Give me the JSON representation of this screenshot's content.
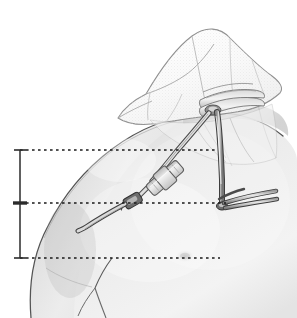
{
  "figure": {
    "title": "Tunneled central venous catheter placement on chest and neck",
    "domain_kind": "medical-illustration",
    "canvas": {
      "width": 297,
      "height": 318,
      "background": "#ffffff"
    },
    "style": {
      "line_color": "#3a3a3a",
      "skin_light": "#f2f2f2",
      "skin_mid": "#d8d8d8",
      "skin_shadow": "#b4b4b4",
      "drape_fill": "#fbfbfb",
      "drape_edge": "#9a9a9a",
      "tube_fill": "#cfcfcf",
      "tube_edge": "#4a4a4a",
      "dotted_color": "#1a1a1a",
      "scale_color": "#2b2b2b"
    },
    "parts": [
      {
        "id": "torso",
        "label": "patient-torso-shoulder",
        "description": "Left shoulder, upper chest and deltoid of a patient, shaded grayscale"
      },
      {
        "id": "neck",
        "label": "patient-neck",
        "description": "Neck region partly covered by the surgical drape"
      },
      {
        "id": "drape",
        "label": "surgical-drape",
        "description": "Translucent fenestrated surgical drape folded over the head and neck"
      },
      {
        "id": "drape-fold",
        "label": "drape-fold-stack",
        "description": "Layered folded edge of drape at the neck base"
      },
      {
        "id": "insertion-site",
        "label": "catheter-insertion-site",
        "description": "Venous puncture site at base of neck under the drape"
      },
      {
        "id": "tunneled-catheter",
        "label": "tunneled-catheter-tube",
        "description": "Catheter tunneled subcutaneously from neck across chest wall"
      },
      {
        "id": "connector",
        "label": "inline-catheter-connector",
        "description": "Barrel connector / suture wing on the tunneled catheter"
      },
      {
        "id": "clamp",
        "label": "catheter-clamp",
        "description": "Small clamp on the catheter at the mid reference level"
      },
      {
        "id": "exit-tube",
        "label": "catheter-exit-limb",
        "description": "Distal catheter limb curving down toward the chest exit site"
      },
      {
        "id": "neck-tube",
        "label": "neck-catheter-limb",
        "description": "Vertical catheter limb descending from the neck insertion"
      },
      {
        "id": "lumen-tails",
        "label": "catheter-lumen-tails",
        "description": "Two catheter lumen tails extending laterally to the right"
      },
      {
        "id": "nipple",
        "label": "nipple-landmark",
        "description": "Faint nipple landmark on the chest at the lower reference level"
      },
      {
        "id": "axilla",
        "label": "axillary-fold",
        "description": "Axillary fold line at lower left of torso"
      }
    ],
    "measurement_scale": {
      "label": "vertical-measurement-scale",
      "axis_x": 20,
      "top_y": 150,
      "middle_y": 203,
      "bottom_y": 258,
      "tick_half_width": 6,
      "middle_tick_thick": true,
      "segments": [
        {
          "name": "upper-segment",
          "from_y": 150,
          "to_y": 203
        },
        {
          "name": "lower-segment",
          "from_y": 203,
          "to_y": 258
        }
      ]
    },
    "reference_lines": [
      {
        "name": "upper-reference-line",
        "y": 150,
        "x_start": 20,
        "x_end": 218,
        "style": "dotted"
      },
      {
        "name": "middle-reference-line",
        "y": 203,
        "x_start": 20,
        "x_end": 226,
        "style": "dotted"
      },
      {
        "name": "lower-reference-line",
        "y": 258,
        "x_start": 20,
        "x_end": 220,
        "style": "dotted"
      }
    ]
  }
}
